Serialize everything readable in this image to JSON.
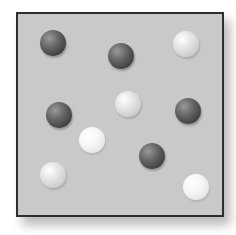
{
  "diagram": {
    "type": "particle-container",
    "container": {
      "fill": "#c9c9c9",
      "border": "#2e2e2e"
    },
    "particle_colors": {
      "dark": "#404040",
      "light": "#d8d8d8",
      "very-light": "#f2f2f2"
    },
    "particles": [
      {
        "kind": "dark",
        "x": 53,
        "y": 43,
        "r": 13
      },
      {
        "kind": "dark",
        "x": 121,
        "y": 56,
        "r": 13
      },
      {
        "kind": "light",
        "x": 186,
        "y": 44,
        "r": 13
      },
      {
        "kind": "light",
        "x": 128,
        "y": 104,
        "r": 13
      },
      {
        "kind": "dark",
        "x": 59,
        "y": 115,
        "r": 13
      },
      {
        "kind": "dark",
        "x": 188,
        "y": 111,
        "r": 13
      },
      {
        "kind": "very-light",
        "x": 92,
        "y": 140,
        "r": 13
      },
      {
        "kind": "dark",
        "x": 152,
        "y": 156,
        "r": 13
      },
      {
        "kind": "light",
        "x": 53,
        "y": 175,
        "r": 13
      },
      {
        "kind": "very-light",
        "x": 196,
        "y": 187,
        "r": 13
      }
    ],
    "counts": {
      "dark": 5,
      "light": 5
    }
  }
}
